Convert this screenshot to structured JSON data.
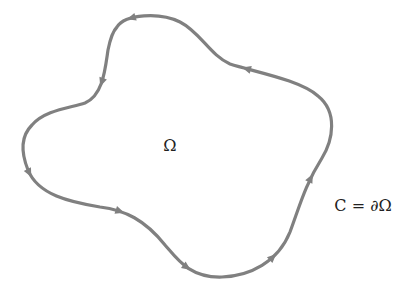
{
  "diagram": {
    "region_label": "Ω",
    "boundary_label": "C = ∂Ω",
    "curve_color": "#808080",
    "text_color": "#222222",
    "orientation": "counterclockwise",
    "arrow_count": 8
  }
}
